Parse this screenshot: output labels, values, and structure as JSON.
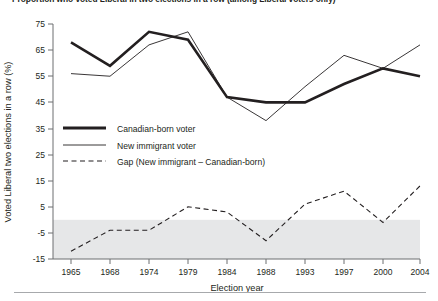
{
  "chart_data": {
    "type": "line",
    "title": "Proportion who voted Liberal in two elections in a row (among Liberal voters only)",
    "xlabel": "Election year",
    "ylabel": "Voted Liberal two elections in a row (%)",
    "categories": [
      "1965",
      "1968",
      "1974",
      "1979",
      "1984",
      "1988",
      "1993",
      "1997",
      "2000",
      "2004"
    ],
    "x": [
      1965,
      1968,
      1974,
      1979,
      1984,
      1988,
      1993,
      1997,
      2000,
      2004
    ],
    "ylim": [
      -15,
      75
    ],
    "yticks": [
      "75",
      "65",
      "55",
      "45",
      "35",
      "25",
      "15",
      "5",
      "-5",
      "-15"
    ],
    "ytick_values": [
      75,
      65,
      55,
      45,
      35,
      25,
      15,
      5,
      -5,
      -15
    ],
    "grid": false,
    "legend_position": "center-left",
    "shaded_band": {
      "from": 0,
      "to": -15,
      "color": "#e6e7e8"
    },
    "series": [
      {
        "name": "Canadian-born voter",
        "style": "solid-thick",
        "color": "#231f20",
        "width": 2.6,
        "values": [
          68,
          59,
          72,
          69,
          47,
          45,
          45,
          52,
          58,
          55
        ]
      },
      {
        "name": "New immigrant voter",
        "style": "solid-thin",
        "color": "#231f20",
        "width": 0.9,
        "values": [
          56,
          55,
          67,
          72,
          47,
          38,
          51,
          63,
          58,
          67
        ]
      },
      {
        "name": "Gap (New immigrant – Canadian-born)",
        "style": "dashed",
        "color": "#231f20",
        "width": 1.1,
        "values": [
          -12,
          -4,
          -4,
          5,
          3,
          -8,
          6,
          11,
          -1,
          13
        ]
      }
    ]
  },
  "legend": {
    "items": [
      {
        "label": "Canadian-born voter",
        "style": "solid-thick"
      },
      {
        "label": "New immigrant voter",
        "style": "solid-thin"
      },
      {
        "label": "Gap (New immigrant – Canadian-born)",
        "style": "dashed"
      }
    ]
  },
  "axes": {
    "x_title": "Election year",
    "y_title": "Voted Liberal two elections in a row (%)"
  }
}
